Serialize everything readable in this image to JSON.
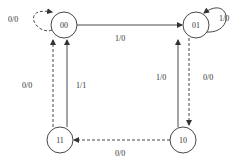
{
  "diagram": {
    "type": "state-transition-diagram",
    "states": [
      {
        "id": "s00",
        "label": "00"
      },
      {
        "id": "s01",
        "label": "01"
      },
      {
        "id": "s11",
        "label": "11"
      },
      {
        "id": "s10",
        "label": "10"
      }
    ],
    "transitions": [
      {
        "from": "00",
        "to": "00",
        "label": "0/0",
        "style": "dashed"
      },
      {
        "from": "00",
        "to": "01",
        "label": "1/0",
        "style": "solid"
      },
      {
        "from": "01",
        "to": "01",
        "label": "1/0",
        "style": "solid"
      },
      {
        "from": "01",
        "to": "10",
        "label": "0/0",
        "style": "dashed"
      },
      {
        "from": "10",
        "to": "01",
        "label": "1/0",
        "style": "solid"
      },
      {
        "from": "10",
        "to": "11",
        "label": "0/0",
        "style": "dashed"
      },
      {
        "from": "11",
        "to": "00",
        "label": "0/0",
        "style": "dashed"
      },
      {
        "from": "11",
        "to": "00",
        "label": "1/1",
        "style": "solid"
      }
    ],
    "colors": {
      "stroke": "#333333",
      "background": "#ffffff"
    }
  }
}
